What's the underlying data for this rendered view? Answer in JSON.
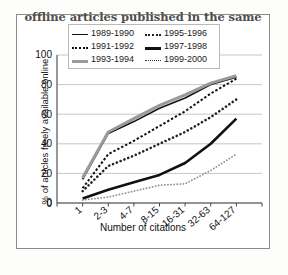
{
  "figure": {
    "caption": "offline articles published in the same",
    "background_color": "#ffffff",
    "frame_color": "#8a8a88"
  },
  "chart_data": {
    "type": "line",
    "title": "offline articles published in the same",
    "xlabel": "Number of citations",
    "ylabel": "% of articles freely available online",
    "categories": [
      "1",
      "2-3",
      "4-7",
      "8-15",
      "16-31",
      "32-63",
      "64-127"
    ],
    "x_tick_labels": [
      "0",
      "1",
      "2-3",
      "4-7",
      "8-15",
      "16-31",
      "32-63",
      "64-127"
    ],
    "y_tick_labels": [
      "0",
      "20",
      "40",
      "60",
      "80",
      "100"
    ],
    "y_ticks": [
      0,
      20,
      40,
      60,
      80,
      100
    ],
    "ylim": [
      0,
      100
    ],
    "grid": true,
    "grid_axis": "y",
    "legend_position": "upper-center-inside",
    "series": [
      {
        "name": "1989-1990",
        "style": "thin-solid",
        "color": "#111111",
        "values": [
          16,
          47,
          55,
          64,
          71,
          80,
          85
        ]
      },
      {
        "name": "1991-1992",
        "style": "dash-black",
        "color": "#111111",
        "values": [
          10,
          33,
          42,
          52,
          62,
          74,
          84
        ]
      },
      {
        "name": "1993-1994",
        "style": "thick-gray",
        "color": "#9a9a98",
        "values": [
          17,
          48,
          57,
          66,
          73,
          81,
          86
        ]
      },
      {
        "name": "1995-1996",
        "style": "dot-coarse",
        "color": "#222222",
        "values": [
          8,
          25,
          32,
          40,
          48,
          58,
          70
        ]
      },
      {
        "name": "1997-1998",
        "style": "thick-black",
        "color": "#111111",
        "values": [
          3,
          9,
          14,
          19,
          27,
          40,
          57
        ]
      },
      {
        "name": "1999-2000",
        "style": "dot-fine",
        "color": "#9a9a98",
        "values": [
          2,
          4,
          8,
          12,
          13,
          22,
          33
        ]
      }
    ]
  },
  "legend": {
    "items": [
      {
        "label": "1989-1990",
        "style": "thin-solid"
      },
      {
        "label": "1995-1996",
        "style": "dot-coarse"
      },
      {
        "label": "1991-1992",
        "style": "dash-black"
      },
      {
        "label": "1997-1998",
        "style": "thick-black"
      },
      {
        "label": "1993-1994",
        "style": "thick-gray"
      },
      {
        "label": "1999-2000",
        "style": "dot-fine"
      }
    ]
  }
}
